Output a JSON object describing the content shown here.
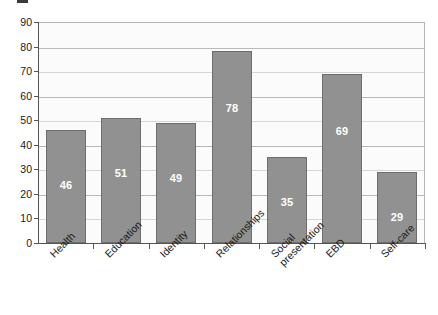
{
  "chart_data": {
    "type": "bar",
    "title": "",
    "subtitle": "",
    "xlabel": "",
    "ylabel": "",
    "categories": [
      "Health",
      "Education",
      "Identity",
      "Relationships",
      "Social presentation",
      "EBD",
      "Self-care"
    ],
    "category_lines": [
      [
        "Health"
      ],
      [
        "Education"
      ],
      [
        "Identity"
      ],
      [
        "Relationships"
      ],
      [
        "Social",
        "presentation"
      ],
      [
        "EBD"
      ],
      [
        "Self-care"
      ]
    ],
    "values": [
      46,
      51,
      49,
      78,
      35,
      69,
      29
    ],
    "value_labels": [
      "46",
      "51",
      "49",
      "78",
      "35",
      "69",
      "29"
    ],
    "ylim": [
      0,
      90
    ],
    "ytick_step": 10,
    "ytick_labels": [
      "90",
      "80",
      "70",
      "60",
      "50",
      "40",
      "30",
      "20",
      "10",
      "0"
    ],
    "grid": true,
    "legend": null,
    "legend_position": "none",
    "colors": {
      "bar_fill": "#919191",
      "bar_border": "#6d6d6d",
      "plot_background": "#fbfbfb",
      "gridline": "#b9b9b9",
      "axis": "#555555",
      "value_label": "#ffffff",
      "tick_label": "#1a1a1a"
    }
  }
}
